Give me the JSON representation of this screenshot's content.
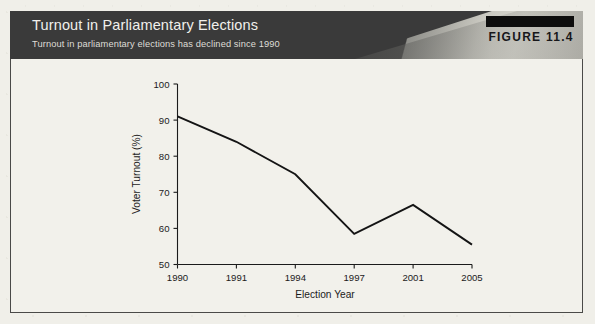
{
  "figure": {
    "tag": "FIGURE 11.4",
    "title": "Turnout in Parliamentary Elections",
    "subtitle": "Turnout in parliamentary elections has declined since 1990"
  },
  "colors": {
    "header_dark": "#3a3a3a",
    "header_light_wedge": "#d7d6ce",
    "tag_bar": "#0d0d0d",
    "line": "#141414",
    "paper": "#f2f1eb"
  },
  "chart_data": {
    "type": "line",
    "title": "Turnout in Parliamentary Elections",
    "subtitle": "Turnout in parliamentary elections has declined since 1990",
    "xlabel": "Election Year",
    "ylabel": "Voter Turnout (%)",
    "categories": [
      "1990",
      "1991",
      "1994",
      "1997",
      "2001",
      "2005"
    ],
    "values": [
      91,
      84,
      75,
      58.5,
      66.5,
      55.5
    ],
    "ylim": [
      50,
      100
    ],
    "yticks": [
      50,
      60,
      70,
      80,
      90,
      100
    ],
    "xticks": [
      "1990",
      "1991",
      "1994",
      "1997",
      "2001",
      "2005"
    ],
    "grid": false,
    "legend": false,
    "series": [
      {
        "name": "Voter Turnout (%)",
        "values": [
          91,
          84,
          75,
          58.5,
          66.5,
          55.5
        ]
      }
    ]
  }
}
